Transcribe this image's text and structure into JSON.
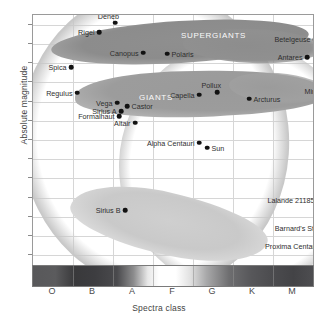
{
  "chart_data": {
    "type": "scatter",
    "title": "",
    "xlabel": "Spectra class",
    "ylabel": "Absolute magnitude",
    "x_tick_labels": [
      "O",
      "B",
      "A",
      "F",
      "G",
      "K",
      "M"
    ],
    "y_tick_labels": [
      "-8",
      "-6",
      "-4",
      "-2",
      "0",
      "2",
      "4",
      "6",
      "8",
      "10",
      "12",
      "14",
      "16"
    ],
    "ylim": [
      -9,
      17
    ],
    "y_inverted": true,
    "grid": true,
    "legend": "none",
    "regions": [
      {
        "name": "SUPERGIANTS",
        "label": "SUPERGIANTS"
      },
      {
        "name": "GIANTS",
        "label": "GIANTS"
      }
    ],
    "points": [
      {
        "name": "Rigel",
        "spectral": "B",
        "magnitude": -7.2,
        "label_side": "left"
      },
      {
        "name": "Deneb",
        "spectral": "B",
        "magnitude": -7.8,
        "label_side": "above"
      },
      {
        "name": "Canopus",
        "spectral": "A",
        "magnitude": -5.5,
        "label_side": "left"
      },
      {
        "name": "Polaris",
        "spectral": "F",
        "magnitude": -5.2,
        "label_side": "right"
      },
      {
        "name": "Betelgeuse",
        "spectral": "M",
        "magnitude": -6.3,
        "label_side": "left"
      },
      {
        "name": "Antares",
        "spectral": "M",
        "magnitude": -5.0,
        "label_side": "left"
      },
      {
        "name": "Spica",
        "spectral": "B",
        "magnitude": -3.6,
        "label_side": "left"
      },
      {
        "name": "Mira",
        "spectral": "M",
        "magnitude": -1.3,
        "label_side": "left"
      },
      {
        "name": "Pollux",
        "spectral": "G",
        "magnitude": -1.1,
        "label_side": "above"
      },
      {
        "name": "Capella",
        "spectral": "G",
        "magnitude": -0.9,
        "label_side": "left"
      },
      {
        "name": "Arcturus",
        "spectral": "K",
        "magnitude": -0.7,
        "label_side": "right"
      },
      {
        "name": "Regulus",
        "spectral": "B",
        "magnitude": -0.9,
        "label_side": "left"
      },
      {
        "name": "Vega",
        "spectral": "A",
        "magnitude": 0.1,
        "label_side": "left"
      },
      {
        "name": "Castor",
        "spectral": "A",
        "magnitude": 0.4,
        "label_side": "right"
      },
      {
        "name": "Sirius A",
        "spectral": "A",
        "magnitude": 1.0,
        "label_side": "left"
      },
      {
        "name": "Formalhaut",
        "spectral": "A",
        "magnitude": 1.6,
        "label_side": "left"
      },
      {
        "name": "Altair",
        "spectral": "A",
        "magnitude": 2.2,
        "label_side": "left"
      },
      {
        "name": "Alpha Centauri",
        "spectral": "G",
        "magnitude": 4.3,
        "label_side": "left"
      },
      {
        "name": "Sun",
        "spectral": "G",
        "magnitude": 4.7,
        "label_side": "right"
      },
      {
        "name": "Sirius B",
        "spectral": "A",
        "magnitude": 11.3,
        "label_side": "left"
      },
      {
        "name": "Lalande 21185",
        "spectral": "M",
        "magnitude": 10.2,
        "label_side": "left"
      },
      {
        "name": "Barnard's Star",
        "spectral": "M",
        "magnitude": 13.1,
        "label_side": "left"
      },
      {
        "name": "Proxima Centauri",
        "spectral": "M",
        "magnitude": 14.8,
        "label_side": "left"
      }
    ]
  },
  "axes": {
    "y_title": "Absolute magnitude",
    "x_title": "Spectra class"
  },
  "caption": ""
}
